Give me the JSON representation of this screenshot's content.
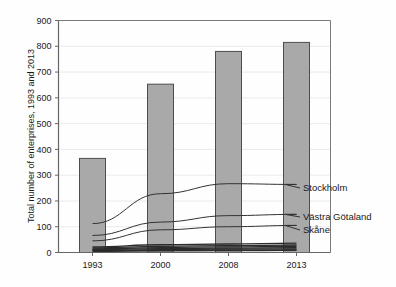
{
  "chart_data": {
    "type": "bar",
    "title": "",
    "subtitle": "",
    "xlabel": "",
    "ylabel": "Total number of enterprises, 1993 and 2013",
    "categories": [
      "1993",
      "2000",
      "2008",
      "2013"
    ],
    "x_tick_labels": [
      "1993",
      "2000",
      "2008",
      "2013"
    ],
    "y_tick_labels": [
      "0",
      "100",
      "200",
      "300",
      "400",
      "500",
      "600",
      "700",
      "800",
      "900"
    ],
    "y_ticks": [
      0,
      100,
      200,
      300,
      400,
      500,
      600,
      700,
      800,
      900
    ],
    "ylim": [
      0,
      900
    ],
    "grid": true,
    "grid_axis": "y",
    "legend": "inline-right-labels",
    "bar_series": {
      "name": "Total",
      "values": [
        365,
        653,
        780,
        815
      ],
      "color": "#a9a9a9",
      "edge_color": "#4d4d4d"
    },
    "series": [
      {
        "name": "Stockholm",
        "values": [
          112,
          228,
          267,
          264
        ],
        "color": "#333333"
      },
      {
        "name": "Västra Götaland",
        "values": [
          66,
          118,
          143,
          148
        ],
        "color": "#333333"
      },
      {
        "name": "Skåne",
        "values": [
          45,
          88,
          100,
          105
        ],
        "color": "#333333"
      },
      {
        "name": "",
        "values": [
          22,
          30,
          33,
          36
        ],
        "color": "#2b2b2b"
      },
      {
        "name": "",
        "values": [
          18,
          24,
          27,
          29
        ],
        "color": "#2b2b2b"
      },
      {
        "name": "",
        "values": [
          14,
          19,
          22,
          24
        ],
        "color": "#2b2b2b"
      },
      {
        "name": "",
        "values": [
          11,
          15,
          17,
          19
        ],
        "color": "#2b2b2b"
      },
      {
        "name": "",
        "values": [
          8,
          11,
          13,
          14
        ],
        "color": "#2b2b2b"
      },
      {
        "name": "",
        "values": [
          6,
          8,
          9,
          10
        ],
        "color": "#2b2b2b"
      },
      {
        "name": "",
        "values": [
          4,
          6,
          7,
          8
        ],
        "color": "#2b2b2b"
      }
    ],
    "annotations": [
      {
        "label": "Stockholm",
        "value": 264
      },
      {
        "label": "Västra Götaland",
        "value": 148
      },
      {
        "label": "Skåne",
        "value": 105
      }
    ]
  },
  "axis": {
    "y_title": "Total number of enterprises, 1993 and 2013"
  },
  "labels": {
    "stockholm": "Stockholm",
    "vastra_gotaland": "Västra Götaland",
    "skane": "Skåne"
  },
  "y_ticks": {
    "t0": "0",
    "t1": "100",
    "t2": "200",
    "t3": "300",
    "t4": "400",
    "t5": "500",
    "t6": "600",
    "t7": "700",
    "t8": "800",
    "t9": "900"
  },
  "x_ticks": {
    "c0": "1993",
    "c1": "2000",
    "c2": "2008",
    "c3": "2013"
  },
  "colors": {
    "bar_fill": "#a9a9a9",
    "bar_edge": "#4d4d4d",
    "line": "#333333",
    "axis": "#666666",
    "grid": "#e8e8e8",
    "text": "#1a1a1a",
    "background": "#fefefe"
  }
}
